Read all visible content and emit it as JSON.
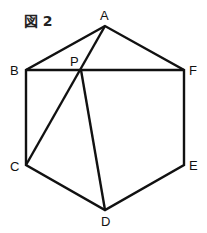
{
  "figure": {
    "title": "図 2",
    "points": {
      "A": "A",
      "B": "B",
      "C": "C",
      "D": "D",
      "E": "E",
      "F": "F",
      "P": "P"
    }
  }
}
